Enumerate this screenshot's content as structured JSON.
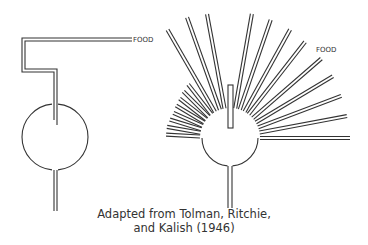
{
  "figure": {
    "stroke_color": "#333333",
    "background": "#ffffff",
    "left_maze": {
      "name": "original maze",
      "goal_label": "FOOD",
      "circle": {
        "cx": 55,
        "cy": 137,
        "r": 33
      },
      "corridor_outer": [
        [
          54,
          120
        ],
        [
          54,
          72
        ],
        [
          22,
          72
        ],
        [
          22,
          38
        ],
        [
          132,
          38
        ]
      ],
      "corridor_inner": [
        [
          57,
          125
        ],
        [
          57,
          69
        ],
        [
          25,
          69
        ],
        [
          25,
          41
        ],
        [
          132,
          41
        ]
      ],
      "start_stem": {
        "x1": 54,
        "x2": 57,
        "y_top": 170,
        "y_bottom": 211
      },
      "label_pos": {
        "x": 133,
        "y": 42
      }
    },
    "right_maze": {
      "name": "sunburst maze",
      "goal_label": "FOOD",
      "circle": {
        "cx": 230,
        "cy": 138,
        "r": 28
      },
      "blocked_stub": {
        "x": 228,
        "y": 85,
        "w": 5,
        "h": 43
      },
      "start_stem": {
        "x1": 228,
        "x2": 232,
        "y_top": 166,
        "y_bottom": 208
      },
      "label_pos": {
        "x": 316,
        "y": 52
      },
      "rays": [
        {
          "angle": 0,
          "length": 120
        },
        {
          "angle": 10.6,
          "length": 119
        },
        {
          "angle": 20.7,
          "length": 119
        },
        {
          "angle": 31,
          "length": 120
        },
        {
          "angle": 41,
          "length": 121
        },
        {
          "angle": 52,
          "length": 122
        },
        {
          "angle": 61,
          "length": 124
        },
        {
          "angle": 71,
          "length": 125
        },
        {
          "angle": 80,
          "length": 126
        },
        {
          "angle": 100.5,
          "length": 126
        },
        {
          "angle": 109.6,
          "length": 128
        },
        {
          "angle": 120,
          "length": 125
        },
        {
          "angle": 128,
          "length": 68
        },
        {
          "angle": 135,
          "length": 66
        },
        {
          "angle": 142,
          "length": 64
        },
        {
          "angle": 149,
          "length": 63
        },
        {
          "angle": 156,
          "length": 62
        },
        {
          "angle": 163,
          "length": 63
        },
        {
          "angle": 170,
          "length": 64
        },
        {
          "angle": 177,
          "length": 64
        }
      ],
      "ray_start_radius": 30,
      "ray_gap": 3
    }
  },
  "caption": {
    "line1": "Adapted from Tolman, Ritchie,",
    "line2": "and Kalish (1946)"
  }
}
